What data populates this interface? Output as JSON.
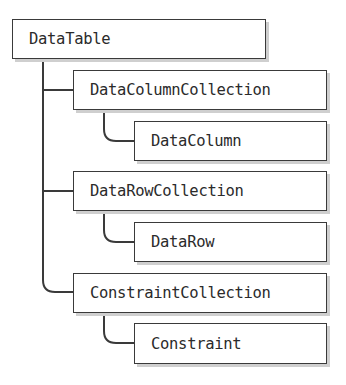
{
  "diagram": {
    "type": "hierarchy-tree",
    "root": {
      "label": "DataTable",
      "children": [
        {
          "label": "DataColumnCollection",
          "children": [
            {
              "label": "DataColumn"
            }
          ]
        },
        {
          "label": "DataRowCollection",
          "children": [
            {
              "label": "DataRow"
            }
          ]
        },
        {
          "label": "ConstraintCollection",
          "children": [
            {
              "label": "Constraint"
            }
          ]
        }
      ]
    },
    "colors": {
      "line": "#3a3a3a",
      "box_fill": "#ffffff",
      "shadow": "#cfcfcf",
      "text": "#2b2b2b"
    }
  }
}
